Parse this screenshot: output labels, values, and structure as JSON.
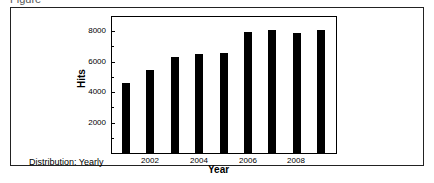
{
  "caption": "Figure",
  "note": "Distribution: Yearly",
  "chart_data": {
    "type": "bar",
    "title": "",
    "xlabel": "Year",
    "ylabel": "Hits",
    "categories": [
      "2001",
      "2002",
      "2003",
      "2004",
      "2005",
      "2006",
      "2007",
      "2008",
      "2009"
    ],
    "values": [
      4550,
      5400,
      6300,
      6500,
      6550,
      7900,
      8050,
      7850,
      8050
    ],
    "x_tick_labels": [
      "2002",
      "2004",
      "2006",
      "2008"
    ],
    "y_tick_labels": [
      "2000",
      "4000",
      "6000",
      "8000"
    ],
    "ylim": [
      0,
      8800
    ],
    "grid": false,
    "legend": null,
    "bar_color": "#000000"
  }
}
